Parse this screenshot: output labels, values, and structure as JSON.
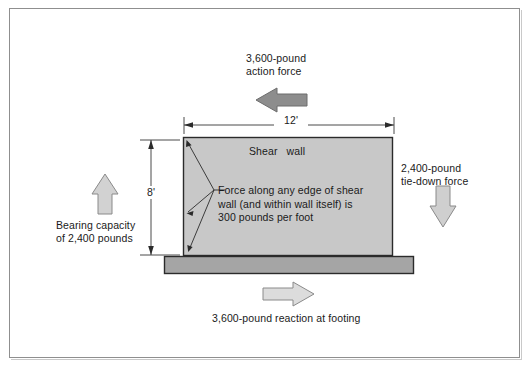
{
  "figure": {
    "background_color": "#ffffff",
    "frame_color": "#8f8f8f"
  },
  "labels": {
    "action_force": "3,600-pound\naction force",
    "width_dimension": "12'",
    "height_dimension": "8'",
    "wall_name": "Shear   wall",
    "force_note": "Force along any edge of shear\nwall (and within wall itself) is\n300 pounds per foot",
    "tie_down_force": "2,400-pound\ntie-down force",
    "bearing_capacity": "Bearing capacity\nof 2,400 pounds",
    "footing_reaction": "3,600-pound reaction at footing"
  },
  "shapes": {
    "shear_wall": {
      "name": "shear-wall",
      "fill": "#c8c8c8",
      "stroke": "#2b2b2b",
      "x": 183,
      "y": 137,
      "width": 209,
      "height": 119
    },
    "footing": {
      "name": "footing",
      "fill": "#a5a5a5",
      "stroke": "#2b2b2b",
      "x": 164,
      "y": 256,
      "width": 249,
      "height": 18
    }
  },
  "arrows": [
    {
      "name": "action-force-arrow",
      "direction": "left",
      "fill": "#8d8d8d",
      "stroke": "#6a6a6a"
    },
    {
      "name": "tie-down-force-arrow",
      "direction": "down",
      "fill": "#cfcfcf",
      "stroke": "#8a8a8a"
    },
    {
      "name": "bearing-capacity-arrow",
      "direction": "up",
      "fill": "#d2d2d2",
      "stroke": "#8a8a8a"
    },
    {
      "name": "footing-reaction-arrow",
      "direction": "right",
      "fill": "#dcdcdc",
      "stroke": "#8a8a8a"
    }
  ],
  "dimensions": [
    {
      "name": "width-dimension",
      "value": "12'",
      "orientation": "horizontal",
      "from": 184,
      "to": 394,
      "axis": 125
    },
    {
      "name": "height-dimension",
      "value": "8'",
      "orientation": "vertical",
      "from": 140,
      "to": 255,
      "axis": 151
    }
  ],
  "leader_lines": [
    {
      "name": "leader-to-top-left-corner",
      "target_x": 186,
      "target_y": 141
    },
    {
      "name": "leader-to-left-edge-mid",
      "target_x": 186,
      "target_y": 213
    },
    {
      "name": "leader-to-bottom-left-corner",
      "target_x": 188,
      "target_y": 252
    }
  ]
}
